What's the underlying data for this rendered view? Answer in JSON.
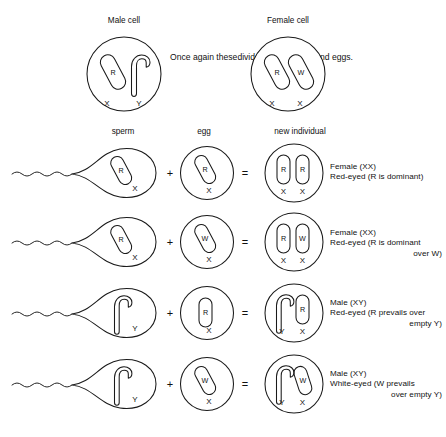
{
  "figure": {
    "title_male": "Male cell",
    "title_female": "Female cell",
    "note": "Once again these\ndivide to form\nsperm and eggs.",
    "note_lines": [
      "Once again these",
      "divide to form",
      "sperm and eggs."
    ],
    "stroke_color": "#1a1a1a",
    "background": "#ffffff"
  },
  "columns": {
    "sperm": "sperm",
    "egg": "egg",
    "new_individual": "new individual"
  },
  "operators": {
    "plus": "+",
    "equals": "="
  },
  "parent_cells": [
    {
      "name": "male-cell",
      "label": "Male cell",
      "chromosomes": [
        {
          "shape": "rod",
          "allele": "R",
          "axis": "X"
        },
        {
          "shape": "hook",
          "allele": "",
          "axis": "Y"
        }
      ]
    },
    {
      "name": "female-cell",
      "label": "Female cell",
      "chromosomes": [
        {
          "shape": "rod",
          "allele": "R",
          "axis": "X"
        },
        {
          "shape": "rod",
          "allele": "W",
          "axis": "X"
        }
      ]
    }
  ],
  "crosses": [
    {
      "sperm": {
        "shape": "rod",
        "allele": "R",
        "axis": "X"
      },
      "egg": {
        "shape": "rod",
        "allele": "R",
        "axis": "X"
      },
      "offspring": [
        {
          "shape": "rod",
          "allele": "R",
          "axis": "X"
        },
        {
          "shape": "rod",
          "allele": "R",
          "axis": "X"
        }
      ],
      "caption_lines": [
        "Female (XX)",
        "Red-eyed (R is dominant)"
      ],
      "caption_align": [
        "left",
        "left"
      ]
    },
    {
      "sperm": {
        "shape": "rod",
        "allele": "R",
        "axis": "X"
      },
      "egg": {
        "shape": "rod",
        "allele": "W",
        "axis": "X"
      },
      "offspring": [
        {
          "shape": "rod",
          "allele": "R",
          "axis": "X"
        },
        {
          "shape": "rod",
          "allele": "W",
          "axis": "X"
        }
      ],
      "caption_lines": [
        "Female (XX)",
        "Red-eyed (R is dominant",
        "over W)"
      ],
      "caption_align": [
        "left",
        "left",
        "right"
      ]
    },
    {
      "sperm": {
        "shape": "hook",
        "allele": "",
        "axis": "Y"
      },
      "egg": {
        "shape": "rod",
        "allele": "R",
        "axis": "X"
      },
      "offspring": [
        {
          "shape": "hook",
          "allele": "",
          "axis": "Y"
        },
        {
          "shape": "rod",
          "allele": "R",
          "axis": "X"
        }
      ],
      "caption_lines": [
        "Male (XY)",
        "Red-eyed (R prevails over",
        "empty Y)"
      ],
      "caption_align": [
        "left",
        "left",
        "right"
      ]
    },
    {
      "sperm": {
        "shape": "hook",
        "allele": "",
        "axis": "Y"
      },
      "egg": {
        "shape": "rod",
        "allele": "W",
        "axis": "X"
      },
      "offspring": [
        {
          "shape": "hook",
          "allele": "",
          "axis": "Y"
        },
        {
          "shape": "rod",
          "allele": "W",
          "axis": "X"
        }
      ],
      "caption_lines": [
        "Male (XY)",
        "White-eyed (W prevails",
        "over empty Y)"
      ],
      "caption_align": [
        "left",
        "left",
        "right"
      ]
    }
  ]
}
